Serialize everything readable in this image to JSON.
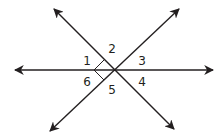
{
  "diagram": {
    "type": "intersecting-lines",
    "colors": {
      "line": "#231f20",
      "background": "#ffffff"
    },
    "intersection": {
      "x": 114,
      "y": 70
    },
    "lines": [
      {
        "name": "horizontal-line",
        "from": {
          "x": 15,
          "y": 70
        },
        "to": {
          "x": 213,
          "y": 70
        },
        "arrows": "both"
      },
      {
        "name": "diagonal-line-down-right",
        "from": {
          "x": 54,
          "y": 9
        },
        "to": {
          "x": 174,
          "y": 129
        },
        "arrows": "both"
      },
      {
        "name": "diagonal-line-up-right",
        "from": {
          "x": 50,
          "y": 131
        },
        "to": {
          "x": 179,
          "y": 9
        },
        "arrows": "both"
      }
    ],
    "right_angle_mark": {
      "between": [
        "diagonal-line-down-right",
        "diagonal-line-up-right"
      ],
      "side": "left"
    },
    "angles": [
      {
        "label": "1",
        "x": 87,
        "y": 65
      },
      {
        "label": "2",
        "x": 112,
        "y": 53
      },
      {
        "label": "3",
        "x": 142,
        "y": 65
      },
      {
        "label": "4",
        "x": 142,
        "y": 86
      },
      {
        "label": "5",
        "x": 112,
        "y": 94
      },
      {
        "label": "6",
        "x": 87,
        "y": 86
      }
    ]
  }
}
